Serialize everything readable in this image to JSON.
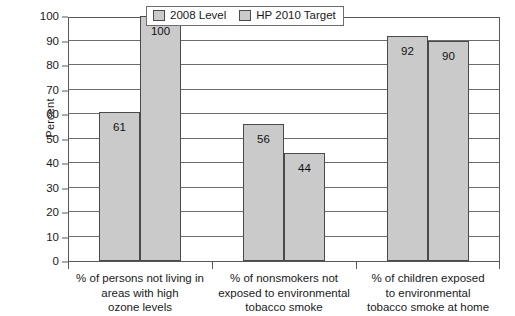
{
  "chart_data": {
    "type": "bar",
    "title": "",
    "xlabel": "",
    "ylabel": "Percent",
    "ylim": [
      0,
      100
    ],
    "ytick_step": 10,
    "yticks": [
      100,
      90,
      80,
      70,
      60,
      50,
      40,
      30,
      20,
      10,
      0
    ],
    "grid": "horizontal",
    "legend_position": "top-center-inside",
    "categories": [
      "% of persons not living in areas with high ozone levels",
      "% of nonsmokers not exposed to environmental tobacco smoke",
      "% of children exposed to environmental tobacco smoke at home"
    ],
    "category_lines": [
      [
        "% of persons not living in",
        "areas with high",
        "ozone levels"
      ],
      [
        "% of nonsmokers not",
        "exposed to environmental",
        "tobacco smoke"
      ],
      [
        "% of children exposed",
        "to environmental",
        "tobacco smoke at home"
      ]
    ],
    "series": [
      {
        "name": "2008 Level",
        "values": [
          61,
          56,
          92
        ],
        "color": "#cacaca"
      },
      {
        "name": "HP 2010 Target",
        "values": [
          100,
          44,
          90
        ],
        "color": "#cacaca"
      }
    ]
  },
  "colors": {
    "bar_fill": "#cacaca",
    "bar_border": "#4a4a4c",
    "axis": "#58585a",
    "grid": "#6d6d70",
    "text": "#1a1a1a",
    "background": "#ffffff"
  }
}
